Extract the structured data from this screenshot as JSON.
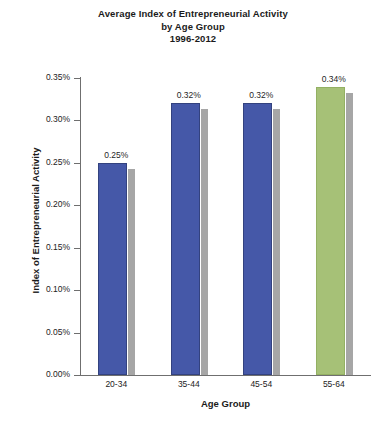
{
  "chart_data": {
    "type": "bar",
    "title": "Average Index of Entrepreneurial Activity by Age Group 1996-2012",
    "title_lines": [
      "Average Index of Entrepreneurial Activity",
      "by Age Group",
      "1996-2012"
    ],
    "xlabel": "Age Group",
    "ylabel": "Index of Entrepreneurial Activity",
    "categories": [
      "20-34",
      "35-44",
      "45-54",
      "55-64"
    ],
    "values": [
      0.25,
      0.32,
      0.32,
      0.34
    ],
    "value_labels": [
      "0.25%",
      "0.32%",
      "0.32%",
      "0.34%"
    ],
    "bar_colors": [
      "#4558a8",
      "#4558a8",
      "#4558a8",
      "#a6c177"
    ],
    "shadow_color": "#a6a6a6",
    "ylim": [
      0.0,
      0.35
    ],
    "ytick_values": [
      0.35,
      0.3,
      0.25,
      0.2,
      0.15,
      0.1,
      0.05,
      0.0
    ],
    "ytick_labels": [
      "0.35%",
      "0.30%",
      "0.25%",
      "0.20%",
      "0.15%",
      "0.10%",
      "0.05%",
      "0.00%"
    ],
    "grid": false,
    "legend": false,
    "legend_position": "none",
    "axis_color": "#6f6f6f",
    "background": "#ffffff"
  }
}
